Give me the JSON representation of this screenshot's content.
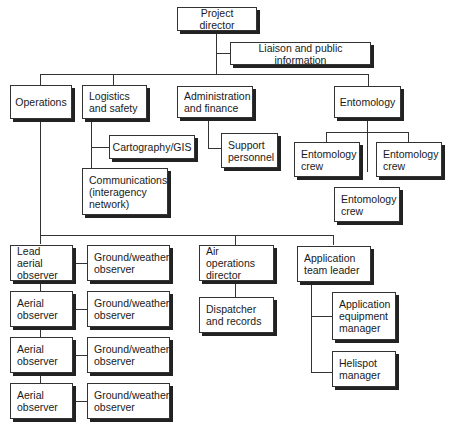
{
  "nodes": {
    "project_director": "Project director",
    "liaison": "Liaison and public information",
    "operations": "Operations",
    "logistics": "Logistics\nand safety",
    "administration": "Administration\nand finance",
    "entomology": "Entomology",
    "cartography": "Cartography/GIS",
    "support": "Support\npersonnel",
    "communications": "Communications\n(interagency\nnetwork)",
    "entomology_crew_1": "Entomology\ncrew",
    "entomology_crew_2": "Entomology\ncrew",
    "entomology_crew_3": "Entomology\ncrew",
    "lead_aerial_observer": "Lead aerial\nobserver",
    "aerial_observer_1": "Aerial\nobserver",
    "aerial_observer_2": "Aerial\nobserver",
    "aerial_observer_3": "Aerial\nobserver",
    "ground_weather_1": "Ground/weather\nobserver",
    "ground_weather_2": "Ground/weather\nobserver",
    "ground_weather_3": "Ground/weather\nobserver",
    "ground_weather_4": "Ground/weather\nobserver",
    "air_operations_director": "Air operations\ndirector",
    "dispatcher": "Dispatcher\nand records",
    "application_team_leader": "Application\nteam leader",
    "application_equipment_manager": "Application\nequipment\nmanager",
    "helispot_manager": "Helispot\nmanager"
  }
}
